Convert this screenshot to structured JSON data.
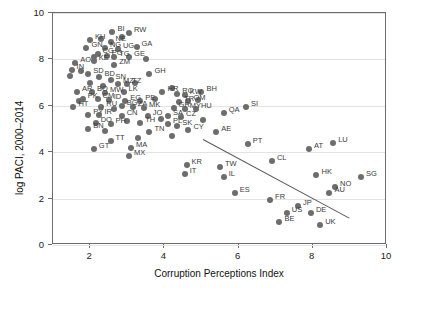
{
  "chart_data": {
    "type": "scatter",
    "title": "",
    "xlabel": "Corruption Perceptions Index",
    "ylabel": "log PACI, 2000–2014",
    "xlim": [
      1,
      10
    ],
    "ylim": [
      0,
      10
    ],
    "xticks": [
      2,
      4,
      6,
      8,
      10
    ],
    "yticks": [
      0,
      2,
      4,
      6,
      8,
      10
    ],
    "grid": "horizontal",
    "legend": "none",
    "fit_line": {
      "x1": 5.05,
      "y1": 4.55,
      "x2": 9.0,
      "y2": 1.15
    },
    "points": [
      {
        "label": "KH",
        "x": 2.0,
        "y": 8.85
      },
      {
        "label": "BI",
        "x": 2.6,
        "y": 9.2
      },
      {
        "label": "RW",
        "x": 3.05,
        "y": 9.15
      },
      {
        "label": "GN",
        "x": 1.9,
        "y": 8.5
      },
      {
        "label": "NE",
        "x": 2.55,
        "y": 8.75
      },
      {
        "label": "NG",
        "x": 2.4,
        "y": 8.5
      },
      {
        "label": "UG",
        "x": 2.75,
        "y": 8.45
      },
      {
        "label": "GA",
        "x": 3.25,
        "y": 8.55
      },
      {
        "label": "CG",
        "x": 2.2,
        "y": 8.25
      },
      {
        "label": "PG",
        "x": 2.45,
        "y": 8.15
      },
      {
        "label": "TG",
        "x": 2.65,
        "y": 8.1
      },
      {
        "label": "GE",
        "x": 3.05,
        "y": 8.1
      },
      {
        "label": "AO",
        "x": 1.6,
        "y": 7.85
      },
      {
        "label": "KE",
        "x": 2.1,
        "y": 7.95
      },
      {
        "label": "ZM",
        "x": 2.65,
        "y": 7.75
      },
      {
        "label": "IN",
        "x": 1.5,
        "y": 7.55
      },
      {
        "label": "SD",
        "x": 1.95,
        "y": 7.35
      },
      {
        "label": "BD",
        "x": 2.25,
        "y": 7.25
      },
      {
        "label": "SN",
        "x": 2.55,
        "y": 7.1
      },
      {
        "label": "GH",
        "x": 3.6,
        "y": 7.35
      },
      {
        "label": "MZ",
        "x": 2.75,
        "y": 6.95
      },
      {
        "label": "TZ",
        "x": 3.0,
        "y": 6.95
      },
      {
        "label": "AR",
        "x": 1.65,
        "y": 6.6
      },
      {
        "label": "BO",
        "x": 2.05,
        "y": 6.6
      },
      {
        "label": "MW",
        "x": 2.4,
        "y": 6.55
      },
      {
        "label": "LK",
        "x": 2.9,
        "y": 6.6
      },
      {
        "label": "HR",
        "x": 3.95,
        "y": 6.6
      },
      {
        "label": "RO",
        "x": 4.35,
        "y": 6.5
      },
      {
        "label": "KW",
        "x": 4.55,
        "y": 6.45
      },
      {
        "label": "BH",
        "x": 5.0,
        "y": 6.6
      },
      {
        "label": "PK",
        "x": 1.8,
        "y": 6.3
      },
      {
        "label": "CM",
        "x": 2.2,
        "y": 6.3
      },
      {
        "label": "ID",
        "x": 2.5,
        "y": 6.25
      },
      {
        "label": "EG",
        "x": 2.95,
        "y": 6.2
      },
      {
        "label": "PE",
        "x": 3.35,
        "y": 6.2
      },
      {
        "label": "TR",
        "x": 4.4,
        "y": 6.15
      },
      {
        "label": "OM",
        "x": 4.65,
        "y": 6.2
      },
      {
        "label": "HT",
        "x": 1.55,
        "y": 5.95
      },
      {
        "label": "RU",
        "x": 2.3,
        "y": 5.95
      },
      {
        "label": "BG",
        "x": 2.85,
        "y": 6.0
      },
      {
        "label": "ZA",
        "x": 3.15,
        "y": 5.95
      },
      {
        "label": "MK",
        "x": 3.45,
        "y": 5.9
      },
      {
        "label": "GR",
        "x": 4.25,
        "y": 5.9
      },
      {
        "label": "MY",
        "x": 4.55,
        "y": 5.85
      },
      {
        "label": "HU",
        "x": 4.85,
        "y": 5.85
      },
      {
        "label": "PY",
        "x": 1.95,
        "y": 5.6
      },
      {
        "label": "IR",
        "x": 2.25,
        "y": 5.6
      },
      {
        "label": "CN",
        "x": 2.85,
        "y": 5.55
      },
      {
        "label": "JO",
        "x": 3.55,
        "y": 5.55
      },
      {
        "label": "SA",
        "x": 4.1,
        "y": 5.55
      },
      {
        "label": "CZ",
        "x": 4.45,
        "y": 5.5
      },
      {
        "label": "QA",
        "x": 5.6,
        "y": 5.7
      },
      {
        "label": "SI",
        "x": 6.2,
        "y": 5.95
      },
      {
        "label": "DO",
        "x": 2.15,
        "y": 5.25
      },
      {
        "label": "PH",
        "x": 2.55,
        "y": 5.2
      },
      {
        "label": "TH",
        "x": 3.35,
        "y": 5.25
      },
      {
        "label": "PL",
        "x": 4.1,
        "y": 5.2
      },
      {
        "label": "SK",
        "x": 4.35,
        "y": 5.15
      },
      {
        "label": "BN",
        "x": 1.95,
        "y": 5.0
      },
      {
        "label": "TN",
        "x": 3.6,
        "y": 4.85
      },
      {
        "label": "CY",
        "x": 4.65,
        "y": 4.95
      },
      {
        "label": "AE",
        "x": 5.4,
        "y": 4.85
      },
      {
        "label": "TT",
        "x": 2.55,
        "y": 4.5
      },
      {
        "label": "GT",
        "x": 2.1,
        "y": 4.15
      },
      {
        "label": "MA",
        "x": 3.1,
        "y": 4.2
      },
      {
        "label": "AT",
        "x": 7.9,
        "y": 4.15
      },
      {
        "label": "LU",
        "x": 8.55,
        "y": 4.4
      },
      {
        "label": "MX",
        "x": 3.05,
        "y": 3.85
      },
      {
        "label": "PT",
        "x": 6.25,
        "y": 4.35
      },
      {
        "label": "KR",
        "x": 4.6,
        "y": 3.45
      },
      {
        "label": "CL",
        "x": 6.9,
        "y": 3.6
      },
      {
        "label": "TW",
        "x": 5.5,
        "y": 3.35
      },
      {
        "label": "IT",
        "x": 4.55,
        "y": 3.05
      },
      {
        "label": "IL",
        "x": 5.6,
        "y": 2.95
      },
      {
        "label": "HK",
        "x": 8.1,
        "y": 3.0
      },
      {
        "label": "SG",
        "x": 9.3,
        "y": 2.95
      },
      {
        "label": "NO",
        "x": 8.6,
        "y": 2.5
      },
      {
        "label": "AU",
        "x": 8.45,
        "y": 2.25
      },
      {
        "label": "ES",
        "x": 5.9,
        "y": 2.25
      },
      {
        "label": "FR",
        "x": 6.85,
        "y": 1.95
      },
      {
        "label": "JP",
        "x": 7.6,
        "y": 1.7
      },
      {
        "label": "US",
        "x": 7.3,
        "y": 1.4
      },
      {
        "label": "DE",
        "x": 7.95,
        "y": 1.4
      },
      {
        "label": "BE",
        "x": 7.1,
        "y": 1.0
      },
      {
        "label": "UK",
        "x": 8.2,
        "y": 0.85
      }
    ],
    "extra_points": [
      {
        "x": 1.45,
        "y": 7.3
      },
      {
        "x": 1.75,
        "y": 7.5
      },
      {
        "x": 2.1,
        "y": 8.1
      },
      {
        "x": 2.3,
        "y": 8.9
      },
      {
        "x": 2.85,
        "y": 8.95
      },
      {
        "x": 3.5,
        "y": 8.0
      },
      {
        "x": 2.0,
        "y": 7.0
      },
      {
        "x": 2.35,
        "y": 6.85
      },
      {
        "x": 3.2,
        "y": 7.0
      },
      {
        "x": 1.7,
        "y": 6.2
      },
      {
        "x": 2.65,
        "y": 5.85
      },
      {
        "x": 3.0,
        "y": 5.35
      },
      {
        "x": 3.75,
        "y": 6.3
      },
      {
        "x": 4.2,
        "y": 6.75
      },
      {
        "x": 4.9,
        "y": 6.25
      },
      {
        "x": 3.9,
        "y": 5.45
      },
      {
        "x": 2.4,
        "y": 4.9
      },
      {
        "x": 3.3,
        "y": 4.6
      },
      {
        "x": 4.2,
        "y": 4.7
      },
      {
        "x": 5.05,
        "y": 5.4
      }
    ]
  },
  "axis": {
    "y_tick_labels": [
      "0",
      "2",
      "4",
      "6",
      "8",
      "10"
    ],
    "x_tick_labels": [
      "2",
      "4",
      "6",
      "8",
      "10"
    ],
    "y_title": "log PACI, 2000–2014",
    "x_title": "Corruption Perceptions Index"
  },
  "colors": {
    "marker": "#6d6d6d",
    "grid": "#e3e3e3",
    "frame": "#6b6b6b",
    "fit": "#5a5a5a",
    "text": "#1a1a1a"
  }
}
